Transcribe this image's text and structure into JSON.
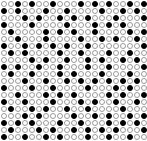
{
  "grid": {
    "columns": 21,
    "rows": 20,
    "cell_pitch_px": 7,
    "colors": {
      "background": "#ffffff",
      "empty_outline": "#9a9a9a",
      "filled": "#000000"
    },
    "legend": {
      "filled": "black-disc",
      "empty": "hollow-disc"
    },
    "pattern_is_illustrative": true,
    "pattern": [
      "001010010001010100101",
      "101000100100001001010",
      "000101001010100010001",
      "100010000100010101000",
      "010000101010010000101",
      "001000100001001010010",
      "100101010100100000001",
      "010100001001000100100",
      "000010100100101001010",
      "101001001000100100001",
      "010010001010001000100",
      "000100100101010101010",
      "100010010000100010100",
      "001000101010000101001",
      "100100010001010010010",
      "010010100100100001000",
      "000101000010010100101",
      "101010001001000101010",
      "010001010010101010001",
      "100100101000100100100"
    ]
  }
}
